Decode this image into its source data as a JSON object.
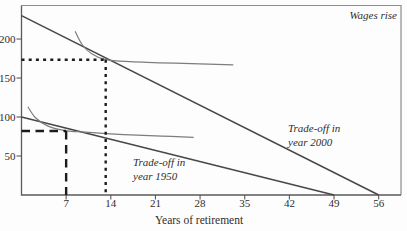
{
  "chart_data": {
    "type": "line",
    "title": "",
    "xlabel": "Years of retirement",
    "ylabel": "",
    "top_right_annotation": "Wages rise",
    "xlim": [
      0,
      59.5
    ],
    "ylim": [
      0,
      243
    ],
    "x_ticks": [
      7,
      14,
      21,
      28,
      35,
      42,
      49,
      56
    ],
    "y_ticks": [
      50,
      100,
      150,
      200
    ],
    "grid": false,
    "legend": "none",
    "series": [
      {
        "name": "tradeoff-1950-line",
        "label_line1": "Trade-off in",
        "label_line2": "year 1950",
        "x": [
          0,
          49
        ],
        "y": [
          100,
          0
        ],
        "color": "#474747",
        "width": 1.5,
        "smooth": false
      },
      {
        "name": "tradeoff-2000-line",
        "label_line1": "Trade-off in",
        "label_line2": "year 2000",
        "x": [
          0,
          56
        ],
        "y": [
          230,
          0
        ],
        "color": "#474747",
        "width": 1.5,
        "smooth": false
      },
      {
        "name": "indifference-curve-1950",
        "x": [
          1.0,
          2.2,
          4.0,
          6.6,
          10,
          16,
          22,
          27
        ],
        "y": [
          113,
          99,
          89,
          83,
          80.5,
          77.5,
          75.5,
          74
        ],
        "color": "#7d7d7d",
        "width": 1.2,
        "smooth": true
      },
      {
        "name": "indifference-curve-2000",
        "x": [
          8.4,
          9.5,
          11,
          13.2,
          17,
          24,
          33.2
        ],
        "y": [
          210,
          193,
          181,
          173.5,
          171,
          169,
          167
        ],
        "color": "#7d7d7d",
        "width": 1.2,
        "smooth": true
      }
    ],
    "optimum_markers": [
      {
        "name": "optimum-1950",
        "years": 7,
        "wage": 82,
        "dash_style": "long-dash",
        "color": "#1c1c1c",
        "width": 2.4
      },
      {
        "name": "optimum-2000",
        "years": 13.2,
        "wage": 173.5,
        "dash_style": "dotted",
        "color": "#1c1c1c",
        "width": 2.4
      }
    ],
    "colors": {
      "axis": "#5a5a5a",
      "frame": "#8d8d8d",
      "text": "#2e2e2e",
      "background": "#fdfdfd"
    }
  }
}
